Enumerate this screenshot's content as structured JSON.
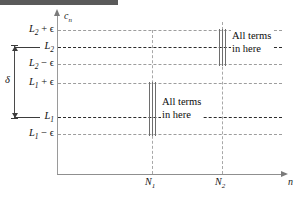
{
  "figure": {
    "width": 303,
    "height": 198
  },
  "axes": {
    "y_axis_label": "c",
    "y_axis_label_sub": "n",
    "x_axis_label": "n"
  },
  "levels": [
    {
      "id": "L2+eps",
      "main": "L",
      "sub": "2",
      "suffix": " + ϵ",
      "y": 30,
      "style": "eps"
    },
    {
      "id": "L2",
      "main": "L",
      "sub": "2",
      "suffix": "",
      "y": 47,
      "style": "limit"
    },
    {
      "id": "L2-eps",
      "main": "L",
      "sub": "2",
      "suffix": " − ϵ",
      "y": 64,
      "style": "eps"
    },
    {
      "id": "L1+eps",
      "main": "L",
      "sub": "1",
      "suffix": " + ϵ",
      "y": 83,
      "style": "eps"
    },
    {
      "id": "L1",
      "main": "L",
      "sub": "1",
      "suffix": "",
      "y": 117,
      "style": "limit"
    },
    {
      "id": "L1-eps",
      "main": "L",
      "sub": "1",
      "suffix": " − ϵ",
      "y": 134,
      "style": "eps"
    }
  ],
  "delta": {
    "symbol": "δ",
    "from_level": "L2",
    "to_level": "L1"
  },
  "n_marks": [
    {
      "id": "N1",
      "main": "N",
      "sub": "1",
      "x": 152
    },
    {
      "id": "N2",
      "main": "N",
      "sub": "2",
      "x": 222
    }
  ],
  "bundles": [
    {
      "id": "bundle-upper",
      "x": 219,
      "top": 30,
      "bottom": 64,
      "tick_count": 3,
      "callout_line1": "All terms",
      "callout_line2": "in here"
    },
    {
      "id": "bundle-lower",
      "x": 149,
      "top": 83,
      "bottom": 134,
      "tick_count": 3,
      "callout_line1": "All terms",
      "callout_line2": "in here"
    }
  ],
  "callouts": {
    "upper": {
      "line1": "All terms",
      "line2": "in here"
    },
    "lower": {
      "line1": "All terms",
      "line2": "in here"
    }
  },
  "colors": {
    "axis": "#8f8f8f",
    "eps_line": "#9d9d9d",
    "limit_line": "#2b2b2b",
    "gridline": "#a8a8a8",
    "term_tick": "#6e6e6e",
    "text": "#111111",
    "top_rule": "#5a5a5a"
  }
}
